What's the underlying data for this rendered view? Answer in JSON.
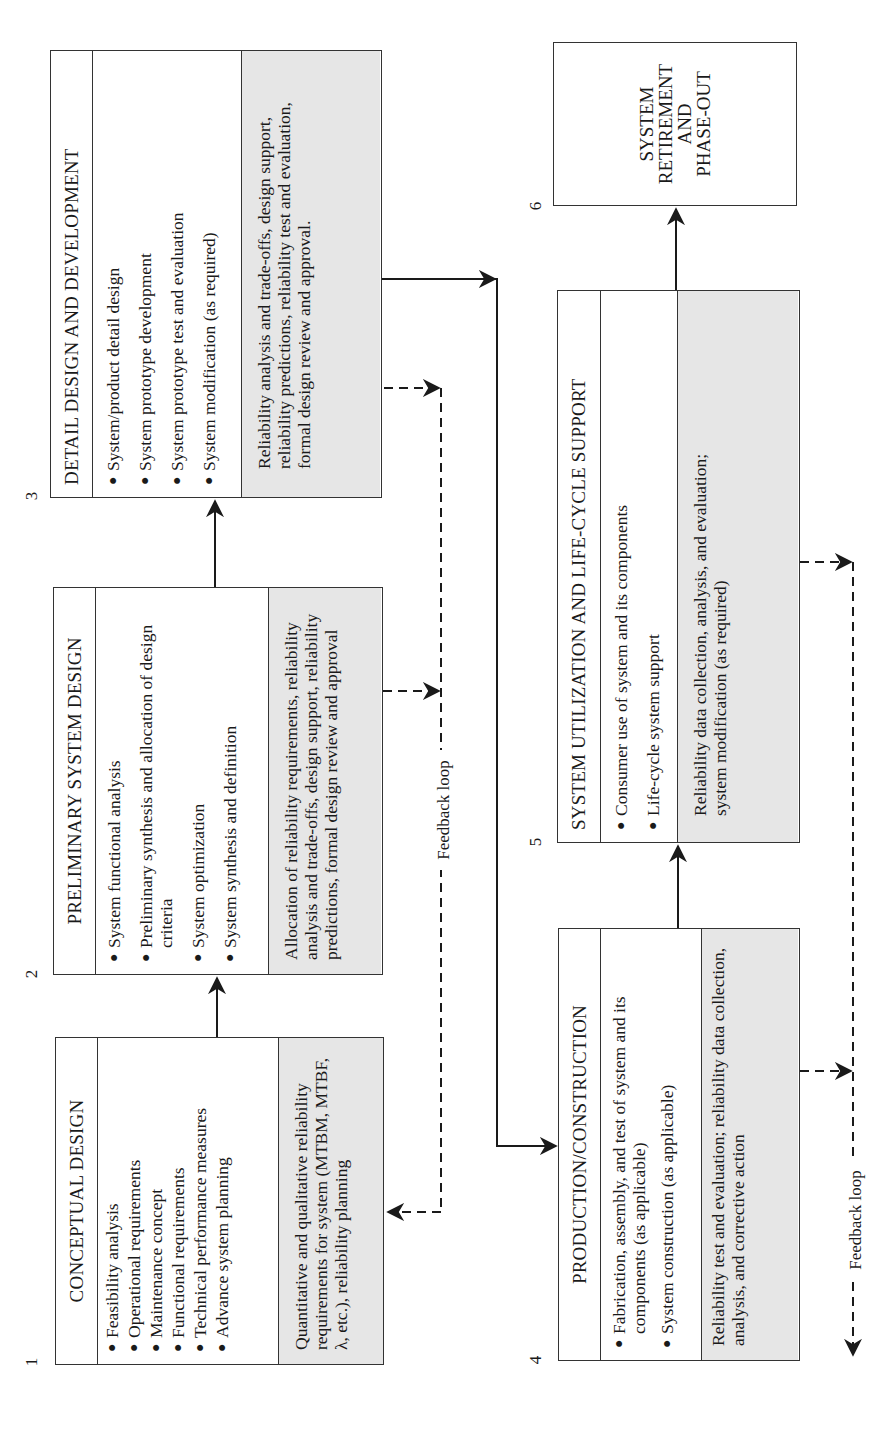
{
  "diagram": {
    "orientation": "rotated 90 degrees counter-clockwise",
    "phases": [
      {
        "number": "1",
        "title": "CONCEPTUAL DESIGN",
        "activities": [
          "Feasibility analysis",
          "Operational requirements",
          "Maintenance concept",
          "Functional requirements",
          "Technical performance measures",
          "Advance system planning"
        ],
        "reliability_tasks": "Quantitative and qualitative reliability requirements for system (MTBM, MTBF, λ, etc.), reliability planning"
      },
      {
        "number": "2",
        "title": "PRELIMINARY SYSTEM DESIGN",
        "activities": [
          "System functional analysis",
          "Preliminary synthesis and allocation of design criteria",
          "System optimization",
          "System synthesis and definition"
        ],
        "reliability_tasks": "Allocation of reliability requirements, reliability analysis and trade-offs, design support, reliability predictions, formal design review and approval"
      },
      {
        "number": "3",
        "title": "DETAIL DESIGN AND DEVELOPMENT",
        "activities": [
          "System/product detail design",
          "System prototype development",
          "System prototype test and evaluation",
          "System modification (as required)"
        ],
        "reliability_tasks": "Reliability analysis and trade-offs, design support, reliability predictions, reliability test and evaluation, formal design review and approval."
      },
      {
        "number": "4",
        "title": "PRODUCTION/CONSTRUCTION",
        "activities": [
          "Fabrication, assembly, and test of system and its components (as applicable)",
          "System construction (as applicable)"
        ],
        "reliability_tasks": "Reliability test and evaluation; reliability data collection, analysis, and corrective action"
      },
      {
        "number": "5",
        "title": "SYSTEM UTILIZATION AND LIFE-CYCLE SUPPORT",
        "activities": [
          "Consumer use of system and its components",
          "Life-cycle system support"
        ],
        "reliability_tasks": "Reliability data collection, analysis, and evaluation; system modification (as required)"
      },
      {
        "number": "6",
        "title_lines": [
          "SYSTEM",
          "RETIREMENT",
          "AND",
          "PHASE-OUT"
        ]
      }
    ],
    "feedback_labels": [
      "Feedback loop",
      "Feedback loop"
    ],
    "bullet": "●",
    "colors": {
      "line": "#1a1a1a",
      "box_border": "#333333",
      "shaded": "#e6e6e6",
      "background": "#ffffff"
    }
  }
}
